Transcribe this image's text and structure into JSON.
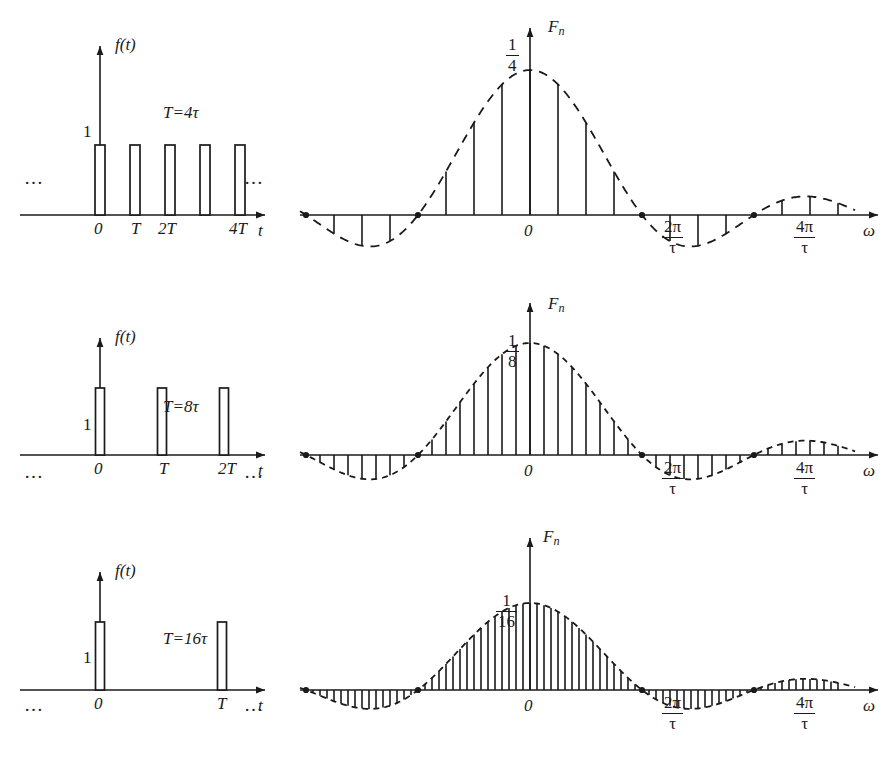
{
  "figure": {
    "axis_color": "#1a1a1a",
    "background": "#ffffff"
  },
  "chart_data": {
    "type": "bar",
    "xlabel": "omega",
    "ylabel": "F_n",
    "grid": false,
    "legend": null,
    "envelope_zeros": [
      "2π/τ",
      "4π/τ"
    ],
    "panels": [
      {
        "id": "row-1",
        "period_label": "T=4τ",
        "ratio": 4,
        "time_domain": {
          "type": "bar",
          "ylabel": "f(t)",
          "xlabel": "t",
          "amplitude_label": "1",
          "amplitude": 1,
          "tick_labels": [
            "0",
            "T",
            "2T",
            "4T"
          ],
          "tick_indices": [
            0,
            1,
            2,
            4
          ],
          "pulse_count_visible": 5,
          "duty_cycle": 0.25,
          "left_ellipsis": "…",
          "right_ellipsis": "…"
        },
        "spectrum": {
          "type": "bar",
          "peak_label_num": "1",
          "peak_label_den": "4",
          "peak_value": 0.25,
          "ylabel": "F",
          "ylabel_sub": "n",
          "xlabel": "ω",
          "origin_label": "0",
          "lines_per_lobe": 4,
          "line_index_min": -11,
          "line_index_max": 11,
          "zero_labels": [
            {
              "num": "2π",
              "den": "τ"
            },
            {
              "num": "4π",
              "den": "τ"
            }
          ]
        }
      },
      {
        "id": "row-2",
        "period_label": "T=8τ",
        "ratio": 8,
        "time_domain": {
          "type": "bar",
          "ylabel": "f(t)",
          "xlabel": "t",
          "amplitude_label": "1",
          "amplitude": 1,
          "tick_labels": [
            "0",
            "T",
            "2T"
          ],
          "tick_indices": [
            0,
            1,
            2
          ],
          "pulse_count_visible": 3,
          "duty_cycle": 0.125,
          "left_ellipsis": "…",
          "right_ellipsis": "…"
        },
        "spectrum": {
          "type": "bar",
          "peak_label_num": "1",
          "peak_label_den": "8",
          "peak_value": 0.125,
          "ylabel": "F",
          "ylabel_sub": "n",
          "xlabel": "ω",
          "origin_label": "0",
          "lines_per_lobe": 8,
          "line_index_min": -22,
          "line_index_max": 22,
          "zero_labels": [
            {
              "num": "2π",
              "den": "τ"
            },
            {
              "num": "4π",
              "den": "τ"
            }
          ]
        }
      },
      {
        "id": "row-3",
        "period_label": "T=16τ",
        "ratio": 16,
        "time_domain": {
          "type": "bar",
          "ylabel": "f(t)",
          "xlabel": "t",
          "amplitude_label": "1",
          "amplitude": 1,
          "tick_labels": [
            "0",
            "T"
          ],
          "tick_indices": [
            0,
            1
          ],
          "pulse_count_visible": 2,
          "duty_cycle": 0.0625,
          "left_ellipsis": "…",
          "right_ellipsis": "…"
        },
        "spectrum": {
          "type": "bar",
          "peak_label_num": "1",
          "peak_label_den": "16",
          "peak_value": 0.0625,
          "ylabel": "F",
          "ylabel_sub": "n",
          "xlabel": "ω",
          "origin_label": "0",
          "lines_per_lobe": 16,
          "line_index_min": -44,
          "line_index_max": 44,
          "zero_labels": [
            {
              "num": "2π",
              "den": "τ"
            },
            {
              "num": "4π",
              "den": "τ"
            }
          ]
        }
      }
    ]
  }
}
